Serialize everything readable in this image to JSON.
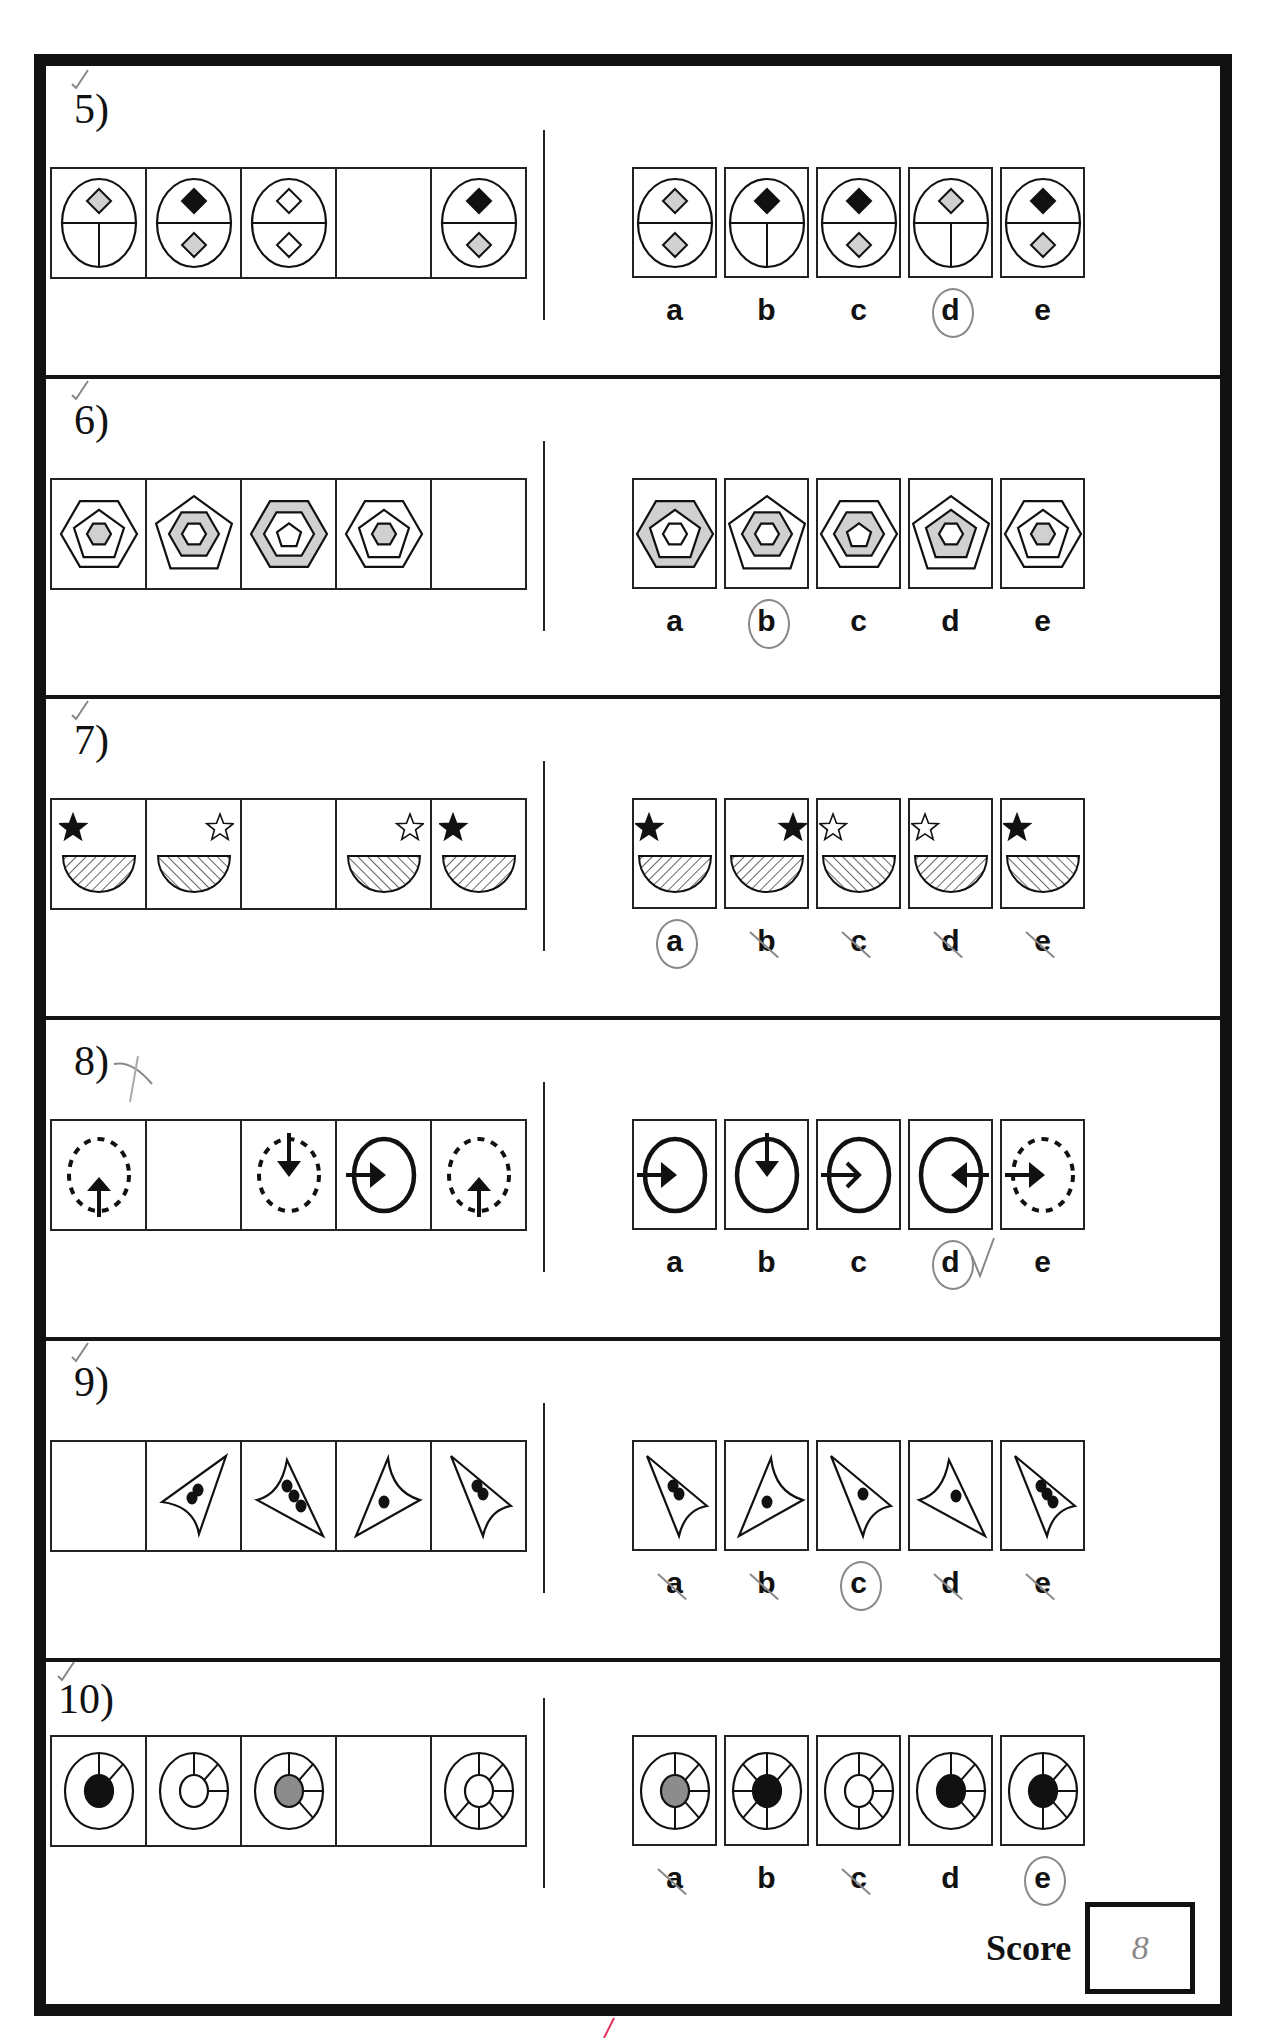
{
  "page": {
    "score_label": "Score",
    "score_value": "8",
    "colors": {
      "ink": "#111111",
      "gray_fill": "#d0d0d0",
      "dark_gray_fill": "#8c8c8c",
      "pencil": "#888888",
      "red_mark": "#e0325a"
    }
  },
  "questions": [
    {
      "number": "5)",
      "pen_mark": "check",
      "sequence": [
        {
          "figure": "circle-split-T",
          "top_diamond": "gray",
          "bottom_diamond": "none"
        },
        {
          "figure": "circle-split-half",
          "top_diamond": "black",
          "bottom_diamond": "gray"
        },
        {
          "figure": "circle-split-half",
          "top_diamond": "white",
          "bottom_diamond": "white"
        },
        {
          "figure": "blank"
        },
        {
          "figure": "circle-split-half",
          "top_diamond": "black",
          "bottom_diamond": "gray"
        }
      ],
      "options": [
        {
          "label": "a",
          "figure": "circle-split-half",
          "top_diamond": "gray",
          "bottom_diamond": "gray",
          "mark": "none"
        },
        {
          "label": "b",
          "figure": "circle-split-T",
          "top_diamond": "black",
          "bottom_diamond": "none",
          "mark": "none"
        },
        {
          "label": "c",
          "figure": "circle-split-half",
          "top_diamond": "black",
          "bottom_diamond": "gray",
          "mark": "none"
        },
        {
          "label": "d",
          "figure": "circle-split-T",
          "top_diamond": "gray",
          "bottom_diamond": "none",
          "mark": "circled"
        },
        {
          "label": "e",
          "figure": "circle-split-half",
          "top_diamond": "black",
          "bottom_diamond": "gray",
          "mark": "none"
        }
      ]
    },
    {
      "number": "6)",
      "pen_mark": "check",
      "sequence": [
        {
          "figure": "nested",
          "outer": "hexagon",
          "middle": "pentagon",
          "inner": "hexagon",
          "shaded": "inner"
        },
        {
          "figure": "nested",
          "outer": "pentagon",
          "middle": "hexagon",
          "inner": "hexagon",
          "shaded": "middle"
        },
        {
          "figure": "nested",
          "outer": "hexagon",
          "middle": "hexagon",
          "inner": "pentagon",
          "shaded": "outer"
        },
        {
          "figure": "nested",
          "outer": "hexagon",
          "middle": "pentagon",
          "inner": "hexagon",
          "shaded": "inner"
        },
        {
          "figure": "blank"
        }
      ],
      "options": [
        {
          "label": "a",
          "figure": "nested",
          "outer": "hexagon",
          "middle": "pentagon",
          "inner": "hexagon",
          "shaded": "outer",
          "mark": "none"
        },
        {
          "label": "b",
          "figure": "nested",
          "outer": "pentagon",
          "middle": "hexagon",
          "inner": "hexagon",
          "shaded": "middle",
          "mark": "circled"
        },
        {
          "label": "c",
          "figure": "nested",
          "outer": "hexagon",
          "middle": "hexagon",
          "inner": "pentagon",
          "shaded": "middle",
          "mark": "none"
        },
        {
          "label": "d",
          "figure": "nested",
          "outer": "pentagon",
          "middle": "pentagon",
          "inner": "hexagon",
          "shaded": "middle",
          "mark": "none"
        },
        {
          "label": "e",
          "figure": "nested",
          "outer": "hexagon",
          "middle": "pentagon",
          "inner": "hexagon",
          "shaded": "inner",
          "mark": "none"
        }
      ]
    },
    {
      "number": "7)",
      "pen_mark": "check",
      "sequence": [
        {
          "figure": "star-bowl",
          "star": "black",
          "star_pos": "left",
          "hatch": "forward"
        },
        {
          "figure": "star-bowl",
          "star": "white",
          "star_pos": "right",
          "hatch": "back"
        },
        {
          "figure": "blank"
        },
        {
          "figure": "star-bowl",
          "star": "white",
          "star_pos": "right",
          "hatch": "back"
        },
        {
          "figure": "star-bowl",
          "star": "black",
          "star_pos": "left",
          "hatch": "forward"
        }
      ],
      "options": [
        {
          "label": "a",
          "figure": "star-bowl",
          "star": "black",
          "star_pos": "left",
          "hatch": "forward",
          "mark": "circled"
        },
        {
          "label": "b",
          "figure": "star-bowl",
          "star": "black",
          "star_pos": "right",
          "hatch": "forward",
          "mark": "struck"
        },
        {
          "label": "c",
          "figure": "star-bowl",
          "star": "white",
          "star_pos": "left",
          "hatch": "back",
          "mark": "struck"
        },
        {
          "label": "d",
          "figure": "star-bowl",
          "star": "white",
          "star_pos": "left",
          "hatch": "forward",
          "mark": "struck"
        },
        {
          "label": "e",
          "figure": "star-bowl",
          "star": "black",
          "star_pos": "left",
          "hatch": "back",
          "mark": "struck"
        }
      ]
    },
    {
      "number": "8)",
      "pen_mark": "cross",
      "sequence": [
        {
          "figure": "arrow-circle",
          "circle": "dashed",
          "arrow": "up-from-bottom"
        },
        {
          "figure": "blank"
        },
        {
          "figure": "arrow-circle",
          "circle": "dashed",
          "arrow": "down-from-top"
        },
        {
          "figure": "arrow-circle",
          "circle": "solid",
          "arrow": "right-from-left"
        },
        {
          "figure": "arrow-circle",
          "circle": "dashed",
          "arrow": "up-from-bottom"
        }
      ],
      "options": [
        {
          "label": "a",
          "figure": "arrow-circle",
          "circle": "solid",
          "arrow": "right-from-left",
          "mark": "none"
        },
        {
          "label": "b",
          "figure": "arrow-circle",
          "circle": "solid",
          "arrow": "down-from-top",
          "mark": "none"
        },
        {
          "label": "c",
          "figure": "arrow-circle",
          "circle": "solid",
          "arrow": "right-open-head",
          "mark": "none"
        },
        {
          "label": "d",
          "figure": "arrow-circle",
          "circle": "solid",
          "arrow": "left-from-right",
          "mark": "circled-check"
        },
        {
          "label": "e",
          "figure": "arrow-circle",
          "circle": "dashed",
          "arrow": "right-from-left",
          "mark": "none"
        }
      ]
    },
    {
      "number": "9)",
      "pen_mark": "check",
      "sequence": [
        {
          "figure": "blank"
        },
        {
          "figure": "curved-triangle",
          "orientation": "up-right",
          "dots": 2
        },
        {
          "figure": "curved-triangle",
          "orientation": "down-right",
          "dots": 3
        },
        {
          "figure": "curved-triangle",
          "orientation": "up",
          "dots": 1
        },
        {
          "figure": "curved-triangle",
          "orientation": "down-left",
          "dots": 2
        }
      ],
      "options": [
        {
          "label": "a",
          "figure": "curved-triangle",
          "orientation": "down-left",
          "dots": 2,
          "mark": "struck"
        },
        {
          "label": "b",
          "figure": "curved-triangle",
          "orientation": "up",
          "dots": 1,
          "mark": "struck"
        },
        {
          "label": "c",
          "figure": "curved-triangle",
          "orientation": "down-left",
          "dots": 1,
          "mark": "circled"
        },
        {
          "label": "d",
          "figure": "curved-triangle",
          "orientation": "down-right",
          "dots": 1,
          "mark": "struck"
        },
        {
          "label": "e",
          "figure": "curved-triangle",
          "orientation": "down-left",
          "dots": 3,
          "mark": "struck"
        }
      ]
    },
    {
      "number": "10)",
      "pen_mark": "check",
      "sequence": [
        {
          "figure": "wheel",
          "center": "black",
          "spokes": 2
        },
        {
          "figure": "wheel",
          "center": "white",
          "spokes": 3
        },
        {
          "figure": "wheel",
          "center": "gray",
          "spokes": 4
        },
        {
          "figure": "blank"
        },
        {
          "figure": "wheel",
          "center": "white",
          "spokes": 6
        }
      ],
      "options": [
        {
          "label": "a",
          "figure": "wheel",
          "center": "gray",
          "spokes": 5,
          "mark": "struck"
        },
        {
          "label": "b",
          "figure": "wheel",
          "center": "black",
          "spokes": 6,
          "mark": "none"
        },
        {
          "label": "c",
          "figure": "wheel",
          "center": "white",
          "spokes": 5,
          "mark": "struck"
        },
        {
          "label": "d",
          "figure": "wheel",
          "center": "black",
          "spokes": 4,
          "mark": "none"
        },
        {
          "label": "e",
          "figure": "wheel",
          "center": "black",
          "spokes": 5,
          "mark": "circled"
        }
      ]
    }
  ]
}
